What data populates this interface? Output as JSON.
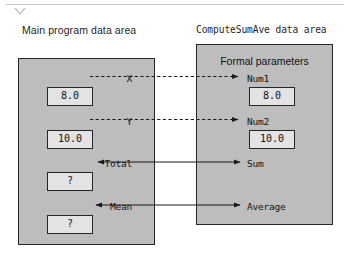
{
  "page": {
    "collapse_marker": "collapse-triangle"
  },
  "headers": {
    "main_area": "Main program data area",
    "sub_area": "ComputeSumAve data area"
  },
  "main_area": {
    "rows": [
      {
        "label": "X",
        "value": "8.0"
      },
      {
        "label": "Y",
        "value": "10.0"
      },
      {
        "label": "Total",
        "value": "?"
      },
      {
        "label": "Mean",
        "value": "?"
      }
    ]
  },
  "sub_area": {
    "title": "Formal parameters",
    "rows": [
      {
        "label": "Num1",
        "value": "8.0"
      },
      {
        "label": "Num2",
        "value": "10.0"
      },
      {
        "label": "Sum",
        "value": ""
      },
      {
        "label": "Average",
        "value": ""
      }
    ]
  },
  "connectors": [
    {
      "name": "x-to-num1",
      "style": "dashed",
      "direction": "right"
    },
    {
      "name": "y-to-num2",
      "style": "dashed",
      "direction": "right"
    },
    {
      "name": "sum-to-total",
      "style": "solid",
      "direction": "both"
    },
    {
      "name": "average-to-mean",
      "style": "solid",
      "direction": "both"
    }
  ],
  "colors": {
    "area_fill": "#bdbdbd",
    "value_fill": "#e3e3e3",
    "stroke": "#262626",
    "rule": "#c9c9c9"
  }
}
